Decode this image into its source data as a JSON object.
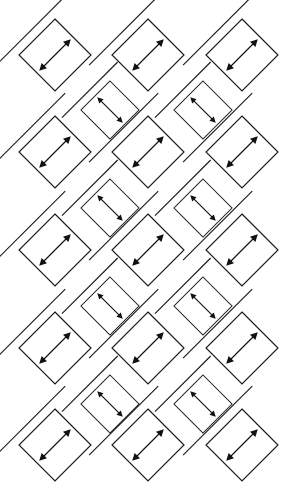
{
  "figure": {
    "type": "geometric-tiling-diagram",
    "canvas": {
      "width": 297,
      "height": 502
    },
    "background_color": "#ffffff",
    "stroke_color": "#1a1a1a",
    "arrow_color": "#111111"
  },
  "geometry": {
    "rotation_degrees": 45,
    "large_cell": {
      "name": "large-diamond",
      "half_diagonal": 36,
      "count": 15,
      "columns": 3,
      "rows": 5,
      "column_centers_x": [
        55,
        148,
        242
      ],
      "row_centers_y": [
        55,
        152,
        250,
        348,
        445
      ],
      "arrow_axis": "southwest-northeast",
      "has_parallel_edge_rule": true,
      "edge_rule_offset": 9,
      "subdivisions": 1
    },
    "small_cell": {
      "name": "small-diamond",
      "half_diagonal": 29,
      "count": 8,
      "columns": 2,
      "rows": 4,
      "column_centers_x": [
        110,
        203
      ],
      "row_centers_y": [
        110,
        208,
        306,
        404
      ],
      "arrow_axis": "northwest-southeast",
      "has_parallel_edge_rule": true,
      "edge_rule_offset": 8,
      "subdivisions": 2,
      "grid_description": "2 by 2 internal grid"
    }
  },
  "legend": {
    "large_cell_label": "large diamond cell",
    "small_cell_label": "small subdivided diamond cell",
    "arrow_label": "double-headed direction arrow",
    "rule_label": "offset parallel rule line"
  },
  "chart_data": {
    "type": "scatter",
    "xlabel": "",
    "ylabel": "",
    "xlim": [
      0,
      297
    ],
    "ylim": [
      0,
      502
    ],
    "grid": false,
    "legend_position": "none",
    "series": [
      {
        "name": "large-diamond",
        "half_diagonal": 36,
        "arrow_axis": "southwest-northeast",
        "subdivisions": 1,
        "x": [
          55,
          148,
          242,
          55,
          148,
          242,
          55,
          148,
          242,
          55,
          148,
          242,
          55,
          148,
          242
        ],
        "y": [
          55,
          55,
          55,
          152,
          152,
          152,
          250,
          250,
          250,
          348,
          348,
          348,
          445,
          445,
          445
        ]
      },
      {
        "name": "small-diamond",
        "half_diagonal": 29,
        "arrow_axis": "northwest-southeast",
        "subdivisions": 2,
        "x": [
          110,
          203,
          110,
          203,
          110,
          203,
          110,
          203
        ],
        "y": [
          110,
          110,
          208,
          208,
          306,
          306,
          404,
          404
        ]
      }
    ]
  }
}
